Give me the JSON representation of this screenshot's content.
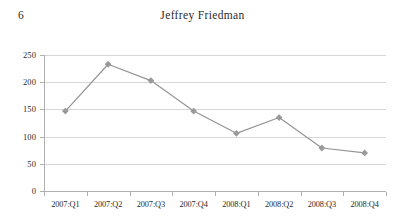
{
  "running_head": {
    "folio": "6",
    "title": "Jeffrey Friedman"
  },
  "chart_data": {
    "type": "line",
    "title": "",
    "subtitle": "",
    "xlabel": "",
    "ylabel": "",
    "categories": [
      "2007:Q1",
      "2007:Q2",
      "2007:Q3",
      "2007:Q4",
      "2008:Q1",
      "2008:Q2",
      "2008:Q3",
      "2008:Q4"
    ],
    "values": [
      147,
      233,
      203,
      147,
      106,
      135,
      79,
      70
    ],
    "series": [
      {
        "name": "",
        "values": [
          147,
          233,
          203,
          147,
          106,
          135,
          79,
          70
        ]
      }
    ],
    "ylim": [
      0,
      250
    ],
    "yticks": [
      0,
      50,
      100,
      150,
      200,
      250
    ],
    "ytick_labels": [
      "0",
      "50",
      "100",
      "150",
      "200",
      "250"
    ],
    "grid": "horizontal",
    "legend": "none",
    "marker": "diamond",
    "colors": {
      "line": "#959595",
      "marker": "#9a9a9a",
      "gridline": "#d7d7d7",
      "axis": "#b0b0b0",
      "text": "#2b2b2b"
    }
  }
}
